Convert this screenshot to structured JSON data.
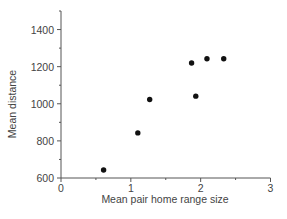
{
  "chart_data": {
    "type": "scatter",
    "title": "",
    "xlabel": "Mean pair home range size",
    "ylabel": "Mean distance",
    "xlim": [
      0,
      3
    ],
    "ylim": [
      600,
      1500
    ],
    "x_ticks": [
      0,
      1,
      2,
      3
    ],
    "x_tick_labels": [
      "0",
      "1",
      "2",
      "3"
    ],
    "y_ticks": [
      600,
      800,
      1000,
      1200,
      1400
    ],
    "y_tick_labels": [
      "600",
      "800",
      "1000",
      "1200",
      "1400"
    ],
    "grid": false,
    "legend": null,
    "series": [
      {
        "name": "pairs",
        "color": "#111111",
        "points": [
          {
            "x": 0.61,
            "y": 643
          },
          {
            "x": 1.1,
            "y": 843
          },
          {
            "x": 1.27,
            "y": 1023
          },
          {
            "x": 1.87,
            "y": 1220
          },
          {
            "x": 1.93,
            "y": 1041
          },
          {
            "x": 2.09,
            "y": 1243
          },
          {
            "x": 2.33,
            "y": 1243
          }
        ]
      }
    ]
  }
}
